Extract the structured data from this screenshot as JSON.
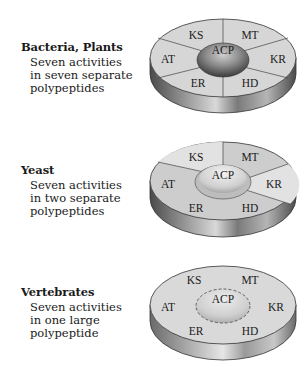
{
  "figure": {
    "panels": [
      {
        "organism": "Bacteria, Plants",
        "desc_lines": [
          "Seven activities",
          "in seven separate",
          "polypeptides"
        ],
        "center_label": "ACP",
        "segments": [
          "KS",
          "MT",
          "KR",
          "HD",
          "ER",
          "AT"
        ],
        "arrangement": "seven separate polypeptides"
      },
      {
        "organism": "Yeast",
        "desc_lines": [
          "Seven activities",
          "in two separate",
          "polypeptides"
        ],
        "center_label": "ACP",
        "segments": [
          "KS",
          "MT",
          "KR",
          "HD",
          "ER",
          "AT"
        ],
        "arrangement": "two separate polypeptides"
      },
      {
        "organism": "Vertebrates",
        "desc_lines": [
          "Seven activities",
          "in one large",
          "polypeptide"
        ],
        "center_label": "ACP",
        "segments": [
          "KS",
          "MT",
          "KR",
          "HD",
          "ER",
          "AT"
        ],
        "arrangement": "one large polypeptide"
      }
    ]
  },
  "colors": {
    "top_face": "#d9d9d9",
    "top_face_alt": "#c8c8c8",
    "side_dark": "#5a5a5a",
    "side_light": "#e6e6e6",
    "acp_dark": "#555555",
    "acp_light": "#e8e8e8",
    "outline": "#333333"
  }
}
